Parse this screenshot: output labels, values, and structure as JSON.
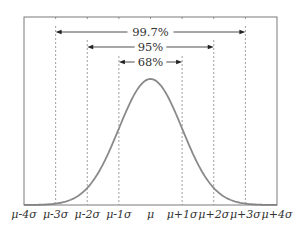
{
  "chart_data": {
    "type": "line",
    "title": "",
    "xlabel": "",
    "ylabel": "",
    "x_ticks": [
      "μ-4σ",
      "μ-3σ",
      "μ-2σ",
      "μ-1σ",
      "μ",
      "μ+1σ",
      "μ+2σ",
      "μ+3σ",
      "μ+4σ"
    ],
    "x_range_sigma": [
      -4,
      4
    ],
    "series": [
      {
        "name": "normal pdf",
        "x_sigma": [
          -4,
          -3,
          -2,
          -1,
          0,
          1,
          2,
          3,
          4
        ],
        "y_relative": [
          0.0003,
          0.011,
          0.135,
          0.607,
          1.0,
          0.607,
          0.135,
          0.011,
          0.0003
        ],
        "color": "#8a8a8a"
      }
    ],
    "intervals": [
      {
        "label": "68%",
        "from_sigma": -1,
        "to_sigma": 1
      },
      {
        "label": "95%",
        "from_sigma": -2,
        "to_sigma": 2
      },
      {
        "label": "99.7%",
        "from_sigma": -3,
        "to_sigma": 3
      }
    ],
    "grid": false,
    "guide_lines": "dashed vertical at ±1σ, ±2σ, ±3σ",
    "legend": null
  },
  "colors": {
    "curve": "#8a8a8a",
    "frame": "#7a7a7a",
    "text": "#333333",
    "guides": "#888888",
    "arrows": "#222222"
  }
}
